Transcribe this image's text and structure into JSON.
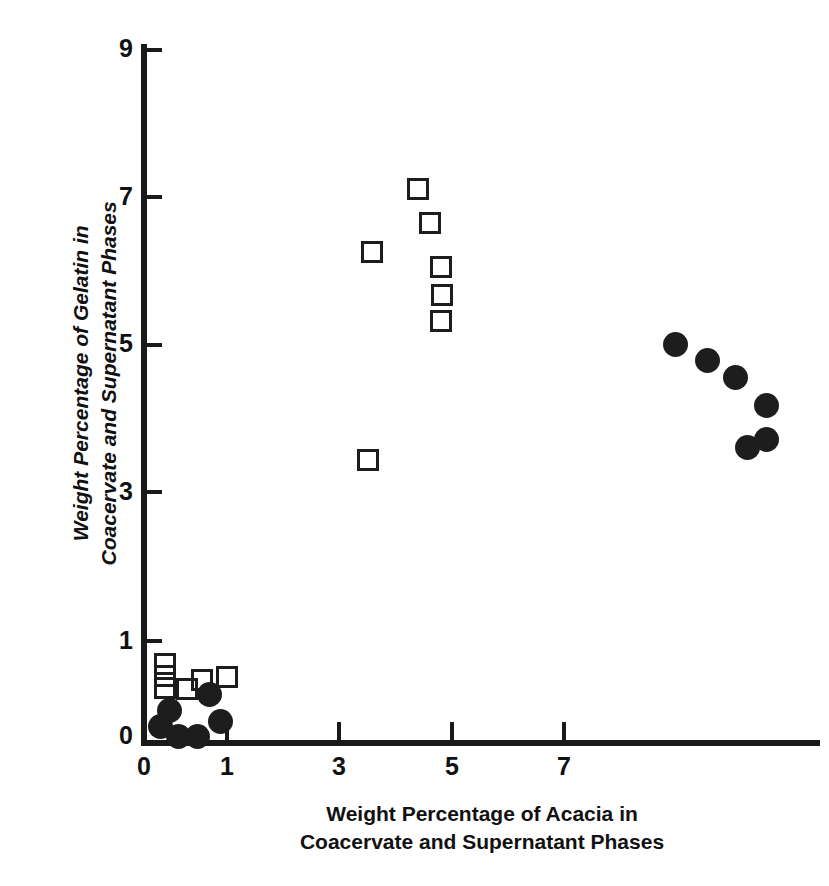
{
  "chart_data": {
    "type": "scatter",
    "title": "",
    "xlabel": "Weight Percentage of Acacia in Coacervate and Supernatant Phases",
    "ylabel": "Weight Percentage of Gelatin in Coacervate and Supernatant Phases",
    "xlabel_lines": [
      "Weight Percentage of Acacia in",
      "Coacervate and Supernatant Phases"
    ],
    "ylabel_lines": [
      "Weight Percentage of Gelatin in",
      "Coacervate and Supernatant Phases"
    ],
    "xlim": [
      0,
      12
    ],
    "ylim": [
      0,
      9.5
    ],
    "xticks": [
      0,
      1,
      3,
      5,
      7
    ],
    "yticks": [
      0,
      1,
      3,
      5,
      7,
      9
    ],
    "xticklabels": [
      "0",
      "1",
      "3",
      "5",
      "7"
    ],
    "yticklabels": [
      "0",
      "1",
      "3",
      "5",
      "7",
      "9"
    ],
    "grid": false,
    "legend": "none",
    "marker_color": "#1d1d1d",
    "series": [
      {
        "name": "open-square",
        "marker": "open square",
        "points": [
          {
            "x": 4.88,
            "y": 7.51
          },
          {
            "x": 5.09,
            "y": 7.05
          },
          {
            "x": 4.05,
            "y": 6.66
          },
          {
            "x": 5.28,
            "y": 6.46
          },
          {
            "x": 5.3,
            "y": 6.08
          },
          {
            "x": 5.28,
            "y": 5.72
          },
          {
            "x": 3.99,
            "y": 3.83
          },
          {
            "x": 0.37,
            "y": 1.06
          },
          {
            "x": 0.37,
            "y": 0.9
          },
          {
            "x": 0.37,
            "y": 0.73
          },
          {
            "x": 1.03,
            "y": 0.84
          },
          {
            "x": 1.48,
            "y": 0.88
          },
          {
            "x": 0.77,
            "y": 0.72
          }
        ]
      },
      {
        "name": "filled-circle",
        "marker": "filled circle",
        "points": [
          {
            "x": 9.45,
            "y": 5.4
          },
          {
            "x": 10.02,
            "y": 5.19
          },
          {
            "x": 10.53,
            "y": 4.95
          },
          {
            "x": 11.07,
            "y": 4.57
          },
          {
            "x": 11.07,
            "y": 4.11
          },
          {
            "x": 10.73,
            "y": 4.0
          },
          {
            "x": 1.17,
            "y": 0.64
          },
          {
            "x": 0.45,
            "y": 0.43
          },
          {
            "x": 0.3,
            "y": 0.21
          },
          {
            "x": 0.61,
            "y": 0.07
          },
          {
            "x": 0.96,
            "y": 0.07
          },
          {
            "x": 1.37,
            "y": 0.28
          }
        ]
      }
    ]
  }
}
